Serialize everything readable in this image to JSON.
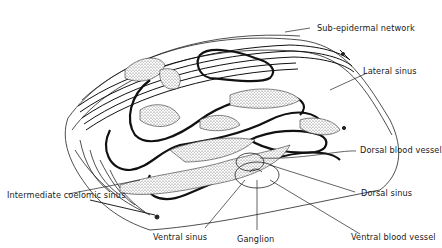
{
  "figure": {
    "labels": {
      "sub_epidermal_network": "Sub-epidermal network",
      "lateral_sinus": "Lateral sinus",
      "dorsal_blood_vessel": "Dorsal blood vessel",
      "dorsal_sinus": "Dorsal sinus",
      "ventral_blood_vessel": "Ventral blood vessel",
      "ganglion": "Ganglion",
      "ventral_sinus": "Ventral sinus",
      "intermediate_coelomic_sinus": "Intermediate coelomic sinus"
    },
    "colors": {
      "ink": "#1a1a1a",
      "background": "#ffffff",
      "stipple": "#7a7a7a"
    }
  }
}
